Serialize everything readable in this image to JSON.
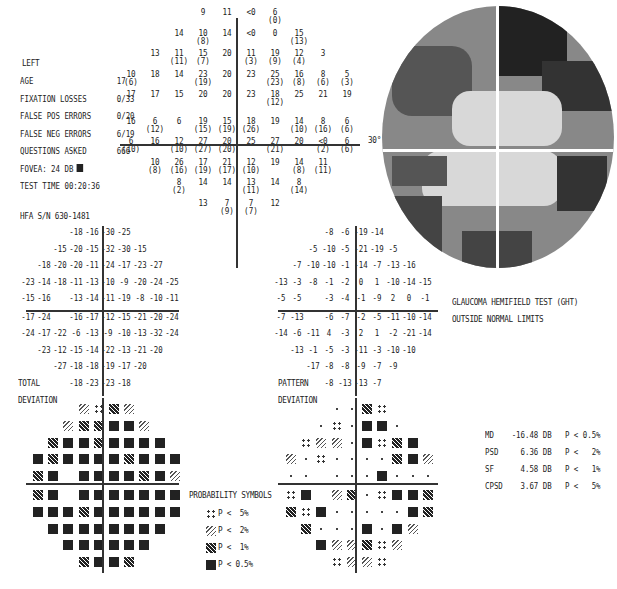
{
  "header": {
    "eye": "LEFT",
    "rows": [
      {
        "label": "AGE",
        "value": "17"
      },
      {
        "label": "FIXATION LOSSES",
        "value": "0/33"
      },
      {
        "label": "FALSE POS ERRORS",
        "value": "0/20"
      },
      {
        "label": "FALSE NEG ERRORS",
        "value": "6/19"
      },
      {
        "label": "QUESTIONS ASKED",
        "value": "666"
      },
      {
        "label": "FOVEA:",
        "value": "24 DB"
      },
      {
        "label": "TEST TIME",
        "value": "00:20:36"
      }
    ],
    "serial": "HFA S/N   630-1481"
  },
  "grayscale": {
    "label": "30°"
  },
  "ght": {
    "line1": "GLAUCOMA HEMIFIELD TEST (GHT)",
    "line2": "OUTSIDE NORMAL LIMITS"
  },
  "labels": {
    "total": "TOTAL",
    "total2": "DEVIATION",
    "pattern": "PATTERN",
    "pattern2": "DEVIATION",
    "prob_title": "PROBABILITY SYMBOLS",
    "prob": [
      "P <  5%",
      "P <  2%",
      "P <  1%",
      "P < 0.5%"
    ]
  },
  "indices": [
    {
      "name": "MD",
      "value": "-16.48 DB",
      "p": "P < 0.5%"
    },
    {
      "name": "PSD",
      "value": "6.36 DB",
      "p": "P <   2%"
    },
    {
      "name": "SF",
      "value": "4.58 DB",
      "p": "P <   1%"
    },
    {
      "name": "CPSD",
      "value": "3.67 DB",
      "p": "P <   5%"
    }
  ],
  "chart_data": [
    {
      "type": "table",
      "title": "Threshold sensitivity (dB), repeat in parentheses",
      "rows": [
        [
          "",
          "",
          "",
          "9",
          "11",
          "<0",
          "6 (0)",
          "",
          "",
          ""
        ],
        [
          "",
          "",
          "14",
          "10 (8)",
          "14",
          "<0",
          "0",
          "15 (13)",
          "",
          ""
        ],
        [
          "",
          "13",
          "11 (11)",
          "15 (7)",
          "20",
          "11 (3)",
          "19 (9)",
          "12 (4)",
          "3",
          ""
        ],
        [
          "10 (6)",
          "18",
          "14",
          "23 (19)",
          "20",
          "23",
          "25 (23)",
          "16 (8)",
          "8 (6)",
          "5 (3)"
        ],
        [
          "17",
          "17",
          "15",
          "20",
          "20",
          "23",
          "18 (12)",
          "25",
          "21",
          "19"
        ],
        [
          "16",
          "6 (12)",
          "6",
          "19 (15)",
          "15 (19)",
          "18 (26)",
          "19",
          "14 (10)",
          "8 (16)",
          "6 (6)"
        ],
        [
          "6 (10)",
          "16",
          "12 (10)",
          "27 (27)",
          "20 (20)",
          "25",
          "27 (21)",
          "20",
          "<0 (2)",
          "6 (6)"
        ],
        [
          "",
          "10 (8)",
          "26 (16)",
          "17 (19)",
          "21 (17)",
          "12 (10)",
          "19",
          "14 (8)",
          "11 (11)",
          ""
        ],
        [
          "",
          "",
          "8 (2)",
          "14",
          "14",
          "13 (11)",
          "14",
          "8 (14)",
          "",
          ""
        ],
        [
          "",
          "",
          "",
          "13",
          "7 (9)",
          "7 (7)",
          "12",
          "",
          "",
          ""
        ]
      ]
    },
    {
      "type": "table",
      "title": "TOTAL DEVIATION",
      "rows": [
        [
          "",
          "",
          "",
          "-18",
          "-16",
          "-30",
          "-25",
          "",
          "",
          ""
        ],
        [
          "",
          "",
          "-15",
          "-20",
          "-15",
          "-32",
          "-30",
          "-15",
          "",
          ""
        ],
        [
          "",
          "-18",
          "-20",
          "-20",
          "-11",
          "-24",
          "-17",
          "-23",
          "-27",
          ""
        ],
        [
          "-23",
          "-14",
          "-18",
          "-11",
          "-13",
          "-10",
          "-9",
          "-20",
          "-24",
          "-25"
        ],
        [
          "-15",
          "-16",
          "",
          "-13",
          "-14",
          "-11",
          "-19",
          "-8",
          "-10",
          "-11"
        ],
        [
          "-17",
          "-24",
          "",
          "-16",
          "-17",
          "-12",
          "-15",
          "-21",
          "-20",
          "-24"
        ],
        [
          "-24",
          "-17",
          "-22",
          "-6",
          "-13",
          "-9",
          "-10",
          "-13",
          "-32",
          "-24"
        ],
        [
          "",
          "-23",
          "-12",
          "-15",
          "-14",
          "-22",
          "-13",
          "-21",
          "-20",
          ""
        ],
        [
          "",
          "",
          "-27",
          "-18",
          "-18",
          "-19",
          "-17",
          "-20",
          "",
          ""
        ],
        [
          "",
          "",
          "",
          "-18",
          "-23",
          "-23",
          "-18",
          "",
          "",
          ""
        ]
      ]
    },
    {
      "type": "table",
      "title": "PATTERN DEVIATION",
      "rows": [
        [
          "",
          "",
          "",
          "-8",
          "-6",
          "-19",
          "-14",
          "",
          "",
          ""
        ],
        [
          "",
          "",
          "-5",
          "-10",
          "-5",
          "-21",
          "-19",
          "-5",
          "",
          ""
        ],
        [
          "",
          "-7",
          "-10",
          "-10",
          "-1",
          "-14",
          "-7",
          "-13",
          "-16",
          ""
        ],
        [
          "-13",
          "-3",
          "-8",
          "-1",
          "-2",
          "0",
          "1",
          "-10",
          "-14",
          "-15"
        ],
        [
          "-5",
          "-5",
          "",
          "-3",
          "-4",
          "-1",
          "-9",
          "2",
          "0",
          "-1"
        ],
        [
          "-7",
          "-13",
          "",
          "-6",
          "-7",
          "-2",
          "-5",
          "-11",
          "-10",
          "-14"
        ],
        [
          "-14",
          "-6",
          "-11",
          "4",
          "-3",
          "2",
          "1",
          "-2",
          "-21",
          "-14"
        ],
        [
          "",
          "-13",
          "-1",
          "-5",
          "-3",
          "-11",
          "-3",
          "-10",
          "-10",
          ""
        ],
        [
          "",
          "",
          "-17",
          "-8",
          "-8",
          "-9",
          "-7",
          "-9",
          "",
          ""
        ],
        [
          "",
          "",
          "",
          "-8",
          "-13",
          "-13",
          "-7",
          "",
          "",
          ""
        ]
      ]
    },
    {
      "type": "heatmap",
      "title": "TOTAL DEVIATION probability map",
      "legend": {
        "p5": "P < 5%",
        "p2": "P < 2%",
        "p1": "P < 1%",
        "blk": "P < 0.5%"
      },
      "rows": [
        [
          "",
          "",
          "",
          "p2",
          "p5",
          "p1",
          "p2",
          "",
          "",
          ""
        ],
        [
          "",
          "",
          "p2",
          "p1",
          "p1",
          "blk",
          "blk",
          "p2",
          "",
          ""
        ],
        [
          "",
          "p1",
          "blk",
          "blk",
          "p1",
          "blk",
          "blk",
          "blk",
          "blk",
          ""
        ],
        [
          "blk",
          "p1",
          "blk",
          "blk",
          "blk",
          "blk",
          "p1",
          "blk",
          "blk",
          "blk"
        ],
        [
          "p1",
          "blk",
          "",
          "blk",
          "blk",
          "blk",
          "blk",
          "p1",
          "blk",
          "p2"
        ],
        [
          "p1",
          "blk",
          "",
          "blk",
          "blk",
          "blk",
          "blk",
          "blk",
          "blk",
          "blk"
        ],
        [
          "blk",
          "blk",
          "blk",
          "p1",
          "blk",
          "blk",
          "blk",
          "blk",
          "blk",
          "blk"
        ],
        [
          "",
          "blk",
          "blk",
          "blk",
          "blk",
          "blk",
          "blk",
          "blk",
          "blk",
          ""
        ],
        [
          "",
          "",
          "blk",
          "blk",
          "blk",
          "blk",
          "blk",
          "blk",
          "",
          ""
        ],
        [
          "",
          "",
          "",
          "p1",
          "blk",
          "blk",
          "p1",
          "",
          "",
          ""
        ]
      ]
    },
    {
      "type": "heatmap",
      "title": "PATTERN DEVIATION probability map",
      "rows": [
        [
          "",
          "",
          "",
          "dot",
          "dot",
          "p1",
          "p5",
          "",
          "",
          ""
        ],
        [
          "",
          "",
          "dot",
          "p5",
          "dot",
          "blk",
          "blk",
          "dot",
          "",
          ""
        ],
        [
          "",
          "p5",
          "p2",
          "p2",
          "dot",
          "blk",
          "p5",
          "p1",
          "blk",
          ""
        ],
        [
          "p2",
          "dot",
          "p5",
          "dot",
          "dot",
          "dot",
          "dot",
          "p1",
          "blk",
          "p2"
        ],
        [
          "dot",
          "dot",
          "",
          "dot",
          "dot",
          "dot",
          "blk",
          "dot",
          "dot",
          "dot"
        ],
        [
          "p5",
          "blk",
          "",
          "p2",
          "p1",
          "dot",
          "p5",
          "blk",
          "blk",
          "p1"
        ],
        [
          "p1",
          "p5",
          "blk",
          "dot",
          "dot",
          "dot",
          "dot",
          "dot",
          "blk",
          "p1"
        ],
        [
          "",
          "p1",
          "dot",
          "dot",
          "dot",
          "blk",
          "dot",
          "blk",
          "p2",
          ""
        ],
        [
          "",
          "",
          "blk",
          "p2",
          "p2",
          "p1",
          "p5",
          "p2",
          "",
          ""
        ],
        [
          "",
          "",
          "",
          "p5",
          "p2",
          "p2",
          "p5",
          "",
          "",
          ""
        ]
      ]
    }
  ]
}
